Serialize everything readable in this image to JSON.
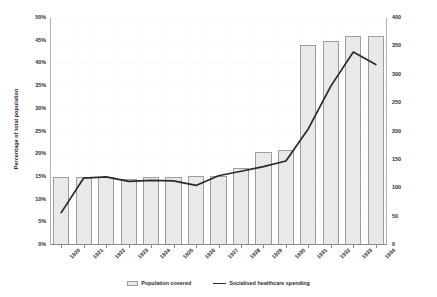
{
  "chart_data": {
    "type": "bar",
    "title": "",
    "categories": [
      "1920",
      "1921",
      "1922",
      "1923",
      "1924",
      "1925",
      "1926",
      "1927",
      "1928",
      "1929",
      "1930",
      "1931",
      "1932",
      "1933",
      "1934"
    ],
    "xlabel": "",
    "ylabel": "Percentage of total population",
    "ylabel_secondary": "Inflation-adjusted francs 1920-1934 (millions)",
    "ylim": [
      0,
      50
    ],
    "ylim_secondary": [
      0,
      400
    ],
    "yticks": [
      "0%",
      "5%",
      "10%",
      "15%",
      "20%",
      "25%",
      "30%",
      "35%",
      "40%",
      "45%",
      "50%"
    ],
    "ytick_values": [
      0,
      5,
      10,
      15,
      20,
      25,
      30,
      35,
      40,
      45,
      50
    ],
    "yticks_secondary": [
      "0",
      "50",
      "100",
      "150",
      "200",
      "250",
      "300",
      "350",
      "400"
    ],
    "ytick_values_secondary": [
      0,
      50,
      100,
      150,
      200,
      250,
      300,
      350,
      400
    ],
    "grid": true,
    "legend_position": "bottom",
    "series": [
      {
        "name": "Population covered",
        "type": "bar",
        "axis": "left",
        "unit": "%",
        "values": [
          15.0,
          15.0,
          15.0,
          14.6,
          15.0,
          15.0,
          15.2,
          15.2,
          17.0,
          20.4,
          21.0,
          44.0,
          45.0,
          46.0,
          46.0
        ],
        "color": "#e9e9e9",
        "edge_color": "#9d9d9d"
      },
      {
        "name": "Socialised healthcare spending",
        "type": "line",
        "axis": "right",
        "unit": "millions of francs",
        "values": [
          57,
          118,
          120,
          112,
          114,
          113,
          105,
          122,
          130,
          138,
          148,
          205,
          280,
          340,
          318
        ],
        "color": "#2a2a2a"
      }
    ]
  },
  "legend": {
    "items": [
      {
        "label": "Population covered",
        "marker": "bar-swatch"
      },
      {
        "label": "Socialised healthcare spending",
        "marker": "line-swatch"
      }
    ]
  }
}
